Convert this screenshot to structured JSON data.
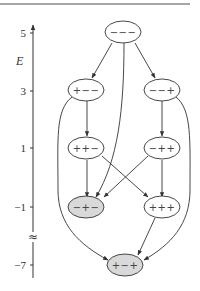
{
  "axis": {
    "title": "E",
    "ticks": [
      {
        "label": "5",
        "y": 33
      },
      {
        "label": "3",
        "y": 91
      },
      {
        "label": "1",
        "y": 148
      },
      {
        "label": "−1",
        "y": 207
      },
      {
        "label": "−7",
        "y": 265
      }
    ],
    "break_symbol": "≈"
  },
  "colors": {
    "line": "#333333",
    "node_fill_default": "#ffffff",
    "node_fill_highlight": "#d9d9d9"
  },
  "nodes": [
    {
      "id": "n1",
      "label": "−−−",
      "energy": 5,
      "highlight": false
    },
    {
      "id": "n2",
      "label": "+−−",
      "energy": 3,
      "highlight": false
    },
    {
      "id": "n3",
      "label": "−−+",
      "energy": 3,
      "highlight": false
    },
    {
      "id": "n4",
      "label": "++−",
      "energy": 1,
      "highlight": false
    },
    {
      "id": "n5",
      "label": "−++",
      "energy": 1,
      "highlight": false
    },
    {
      "id": "n6",
      "label": "−+−",
      "energy": -1,
      "highlight": true
    },
    {
      "id": "n7",
      "label": "+++",
      "energy": -1,
      "highlight": false
    },
    {
      "id": "n8",
      "label": "+−+",
      "energy": -7,
      "highlight": true
    }
  ],
  "edges": [
    {
      "from": "−−−",
      "to": "+−−"
    },
    {
      "from": "−−−",
      "to": "−−+"
    },
    {
      "from": "−−−",
      "to": "−+−"
    },
    {
      "from": "+−−",
      "to": "++−"
    },
    {
      "from": "+−−",
      "to": "+−+"
    },
    {
      "from": "−−+",
      "to": "−++"
    },
    {
      "from": "−−+",
      "to": "+−+"
    },
    {
      "from": "++−",
      "to": "−+−"
    },
    {
      "from": "++−",
      "to": "+++"
    },
    {
      "from": "−++",
      "to": "−+−"
    },
    {
      "from": "−++",
      "to": "+++"
    },
    {
      "from": "+++",
      "to": "+−+"
    }
  ]
}
